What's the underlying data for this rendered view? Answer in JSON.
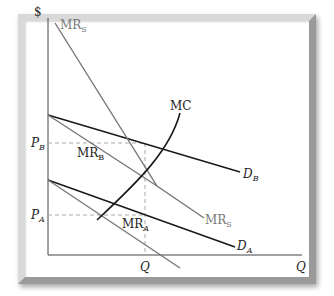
{
  "diagram": {
    "title": "",
    "axes": {
      "y_label": "$",
      "x_label": "Q"
    },
    "ticks": {
      "y": [
        {
          "label": "P",
          "sub": "B",
          "y": 143
        },
        {
          "label": "P",
          "sub": "A",
          "y": 215
        }
      ],
      "x": [
        {
          "label": "Q",
          "x": 145
        }
      ]
    },
    "curves": [
      {
        "name": "D_B",
        "label": "D",
        "sub": "B",
        "color": "#1a1a1a"
      },
      {
        "name": "D_A",
        "label": "D",
        "sub": "A",
        "color": "#1a1a1a"
      },
      {
        "name": "MR_B",
        "label": "MR",
        "sub": "B",
        "color": "#6e6e6e"
      },
      {
        "name": "MR_A",
        "label": "MR",
        "sub": "A",
        "color": "#6e6e6e"
      },
      {
        "name": "MR_S",
        "label": "MR",
        "sub": "S",
        "color": "#6e6e6e"
      },
      {
        "name": "MC",
        "label": "MC",
        "sub": "",
        "color": "#1a1a1a"
      }
    ],
    "colors": {
      "dark_line": "#1a1a1a",
      "grey_line": "#777777",
      "dashed": "#aaaaaa",
      "frame": "#cfcfcf"
    }
  }
}
